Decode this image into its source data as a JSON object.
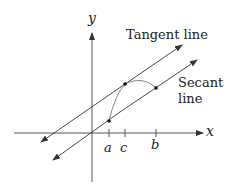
{
  "diagram": {
    "axes": {
      "x_label": "x",
      "y_label": "y"
    },
    "ticks": [
      {
        "label": "a",
        "x": 109
      },
      {
        "label": "c",
        "x": 125
      },
      {
        "label": "b",
        "x": 156
      }
    ],
    "labels": {
      "tangent": "Tangent line",
      "secant_line1": "Secant",
      "secant_line2": "line"
    },
    "points": [
      {
        "name": "A",
        "x": 109,
        "y": 121
      },
      {
        "name": "C",
        "x": 125,
        "y": 84
      },
      {
        "name": "B",
        "x": 156,
        "y": 88
      }
    ],
    "colors": {
      "stroke": "#333333",
      "curve": "#777777",
      "background": "#ffffff"
    }
  }
}
